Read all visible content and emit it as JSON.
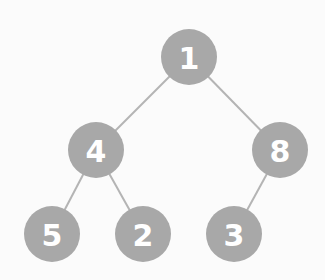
{
  "diagram": {
    "type": "binary-tree",
    "colors": {
      "background": "#fbfbfb",
      "node_fill": "#a8a8a8",
      "node_text": "#ffffff",
      "edge": "#b4b4b4"
    },
    "node_radius": 28,
    "nodes": [
      {
        "id": "n1",
        "label": "1",
        "cx": 189,
        "cy": 57
      },
      {
        "id": "n4",
        "label": "4",
        "cx": 96,
        "cy": 150
      },
      {
        "id": "n8",
        "label": "8",
        "cx": 280,
        "cy": 150
      },
      {
        "id": "n5",
        "label": "5",
        "cx": 52,
        "cy": 234
      },
      {
        "id": "n2",
        "label": "2",
        "cx": 143,
        "cy": 234
      },
      {
        "id": "n3",
        "label": "3",
        "cx": 234,
        "cy": 234
      }
    ],
    "edges": [
      {
        "from": "n1",
        "to": "n4"
      },
      {
        "from": "n1",
        "to": "n8"
      },
      {
        "from": "n4",
        "to": "n5"
      },
      {
        "from": "n4",
        "to": "n2"
      },
      {
        "from": "n8",
        "to": "n3"
      }
    ]
  }
}
